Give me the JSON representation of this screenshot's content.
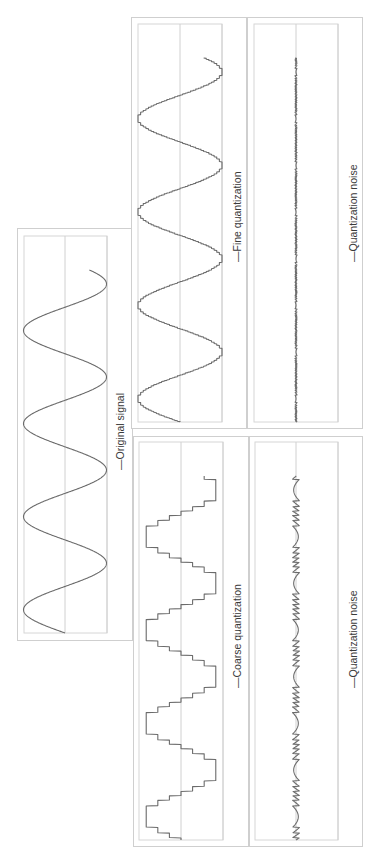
{
  "page": {
    "orientation": "rotated 90 degrees counter-clockwise",
    "background": "#ffffff",
    "trace_color": "#6b6b6b",
    "grid_color": "#d0d0d0"
  },
  "panels": [
    {
      "id": "original",
      "legend": "Original signal"
    },
    {
      "id": "fine",
      "legend": "Fine quantization"
    },
    {
      "id": "fine_noise",
      "legend": "Quantization noise"
    },
    {
      "id": "coarse",
      "legend": "Coarse quantization"
    },
    {
      "id": "coarse_noise",
      "legend": "Quantization noise"
    }
  ],
  "chart_data": [
    {
      "type": "line",
      "title": "",
      "legend": [
        "Original signal"
      ],
      "xlabel": "",
      "ylabel": "",
      "description": "Continuous sine wave, about 3.9 cycles, amplitude ±1",
      "ylim": [
        -1,
        1
      ],
      "grid": true,
      "cycles": 3.9,
      "series": [
        {
          "name": "Original signal",
          "function": "sin",
          "amplitude": 1,
          "levels": null
        }
      ]
    },
    {
      "type": "line",
      "title": "",
      "legend": [
        "Fine quantization"
      ],
      "xlabel": "",
      "ylabel": "",
      "description": "Same sine wave quantized with fine step (~16 levels per half-amplitude)",
      "ylim": [
        -1,
        1
      ],
      "grid": true,
      "cycles": 3.9,
      "series": [
        {
          "name": "Fine quantization",
          "function": "sin",
          "amplitude": 1,
          "step": 0.0625
        }
      ]
    },
    {
      "type": "line",
      "title": "",
      "legend": [
        "Quantization noise"
      ],
      "xlabel": "",
      "ylabel": "",
      "description": "Difference between fine quantized and original signal; very small amplitude",
      "ylim": [
        -1,
        1
      ],
      "grid": true,
      "series": [
        {
          "name": "Quantization noise",
          "derived_from": "fine",
          "max_abs": 0.03
        }
      ]
    },
    {
      "type": "line",
      "title": "",
      "legend": [
        "Coarse quantization"
      ],
      "xlabel": "",
      "ylabel": "",
      "description": "Same sine wave quantized in coarse steps (7 levels: -0.9,-0.6,-0.3,0,0.3,0.6,0.9)",
      "ylim": [
        -1,
        1
      ],
      "grid": true,
      "cycles": 3.9,
      "series": [
        {
          "name": "Coarse quantization",
          "function": "sin",
          "amplitude": 1,
          "step": 0.3
        }
      ]
    },
    {
      "type": "line",
      "title": "",
      "legend": [
        "Quantization noise"
      ],
      "xlabel": "",
      "ylabel": "",
      "description": "Difference between coarse quantized and original signal; bounded by ±step/2",
      "ylim": [
        -1,
        1
      ],
      "grid": true,
      "series": [
        {
          "name": "Quantization noise",
          "derived_from": "coarse",
          "max_abs": 0.15
        }
      ]
    }
  ]
}
